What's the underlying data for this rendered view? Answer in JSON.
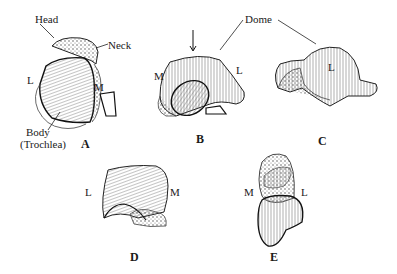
{
  "figure": {
    "panels": [
      {
        "id": "A",
        "label": "A",
        "side_labels": [
          "L",
          "M"
        ],
        "annotations": [
          "Head",
          "Neck",
          "Body",
          "(Trochlea)"
        ]
      },
      {
        "id": "B",
        "label": "B",
        "side_labels": [
          "M",
          "L"
        ],
        "annotations": [
          "Dome"
        ]
      },
      {
        "id": "C",
        "label": "C",
        "side_labels": [
          "L"
        ],
        "annotations": []
      },
      {
        "id": "D",
        "label": "D",
        "side_labels": [
          "L",
          "M"
        ],
        "annotations": []
      },
      {
        "id": "E",
        "label": "E",
        "side_labels": [
          "M",
          "L"
        ],
        "annotations": []
      }
    ],
    "annotations": {
      "head": "Head",
      "neck": "Neck",
      "body": "Body",
      "trochlea": "(Trochlea)",
      "dome": "Dome"
    },
    "colors": {
      "ink": "#1a1a1a",
      "background": "#ffffff",
      "bone_shade": "#bdbdbd"
    }
  }
}
